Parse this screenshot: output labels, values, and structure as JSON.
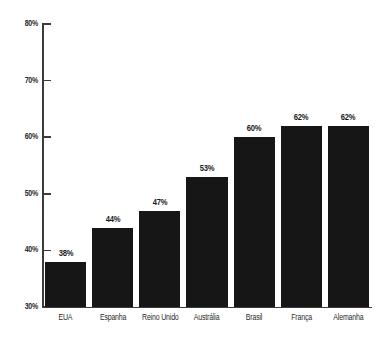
{
  "chart_data": {
    "type": "bar",
    "title": "",
    "subtitle": "",
    "xlabel": "",
    "ylabel": "",
    "categories": [
      "EUA",
      "Espanha",
      "Reino Unido",
      "Austrália",
      "Brasil",
      "França",
      "Alemanha"
    ],
    "values": [
      38,
      44,
      47,
      53,
      60,
      62,
      62
    ],
    "value_labels": [
      "38%",
      "44%",
      "47%",
      "53%",
      "60%",
      "62%",
      "62%"
    ],
    "ylim": [
      30,
      80
    ],
    "ytick_values": [
      30,
      40,
      50,
      60,
      70,
      80
    ],
    "ytick_labels": [
      "30%",
      "40%",
      "50%",
      "60%",
      "70%",
      "80%"
    ],
    "grid": false,
    "legend": null,
    "legend_position": "none",
    "bar_color": "#161616",
    "axis_color": "#3c3c3c",
    "text_color": "#2b2b2b",
    "background_color": "#ffffff"
  }
}
